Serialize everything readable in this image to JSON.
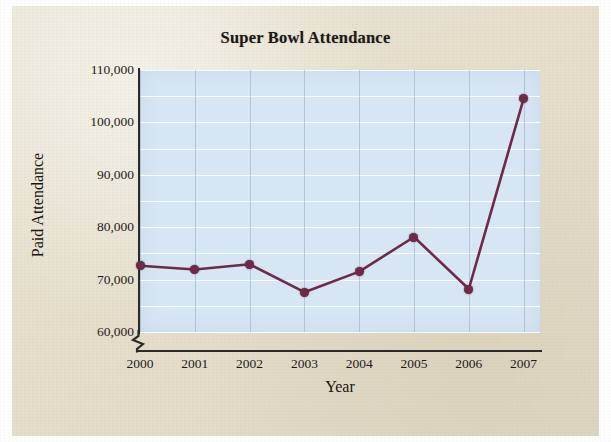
{
  "chart_data": {
    "type": "line",
    "title": "Super Bowl Attendance",
    "xlabel": "Year",
    "ylabel": "Paid Attendance",
    "categories": [
      "2000",
      "2001",
      "2002",
      "2003",
      "2004",
      "2005",
      "2006",
      "2007"
    ],
    "values": [
      72625,
      71921,
      72922,
      67603,
      71525,
      78125,
      68206,
      104500
    ],
    "series": [
      {
        "name": "Paid Attendance",
        "values": [
          72625,
          71921,
          72922,
          67603,
          71525,
          78125,
          68206,
          104500
        ]
      }
    ],
    "x_tick_labels": [
      "2000",
      "2001",
      "2002",
      "2003",
      "2004",
      "2005",
      "2006",
      "2007"
    ],
    "y_tick_labels": [
      "110,000",
      "100,000",
      "90,000",
      "80,000",
      "70,000",
      "60,000"
    ],
    "y_tick_values": [
      110000,
      100000,
      90000,
      80000,
      70000,
      60000
    ],
    "ylim": [
      60000,
      110000
    ],
    "y_minor_step": 5000,
    "grid": true,
    "grid_horizontal": true,
    "grid_vertical": true,
    "legend": false,
    "legend_position": "none",
    "axis_break": true,
    "axis_break_note": "y-axis broken below 60,000",
    "colors": {
      "line": "#6e2a48",
      "marker": "#6e2a48",
      "plot_background": "#d7e6f4",
      "figure_background": "#e5dfcc",
      "horizontal_gridline": "#ffffff",
      "vertical_gridline": "#9ab0c8",
      "axis": "#2b2a28",
      "text": "#1e1c18"
    }
  },
  "figure": {
    "title": "Super Bowl Attendance",
    "x_axis_title": "Year",
    "y_axis_title": "Paid Attendance"
  },
  "icons": {
    "axis_break": "axis-break-zigzag-icon"
  }
}
